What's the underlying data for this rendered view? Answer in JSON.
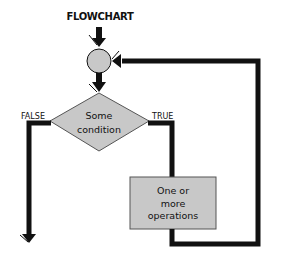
{
  "diagram": {
    "title": "FLOWCHART",
    "nodes": [
      {
        "id": "junction",
        "shape": "circle",
        "label": ""
      },
      {
        "id": "condition",
        "shape": "diamond",
        "label_lines": [
          "Some",
          "condition"
        ]
      },
      {
        "id": "operations",
        "shape": "rectangle",
        "label_lines": [
          "One or",
          "more",
          "operations"
        ]
      }
    ],
    "edges": [
      {
        "from": "start",
        "to": "junction",
        "label": ""
      },
      {
        "from": "junction",
        "to": "condition",
        "label": ""
      },
      {
        "from": "condition",
        "to": "operations",
        "label": "TRUE"
      },
      {
        "from": "operations",
        "to": "junction",
        "label": ""
      },
      {
        "from": "condition",
        "to": "exit",
        "label": "FALSE"
      }
    ],
    "labels": {
      "false": "FALSE",
      "true": "TRUE",
      "condition_line1": "Some",
      "condition_line2": "condition",
      "ops_line1": "One or",
      "ops_line2": "more",
      "ops_line3": "operations"
    },
    "colors": {
      "shape_fill": "#c8c8c8",
      "line": "#111111",
      "background": "#ffffff"
    }
  }
}
